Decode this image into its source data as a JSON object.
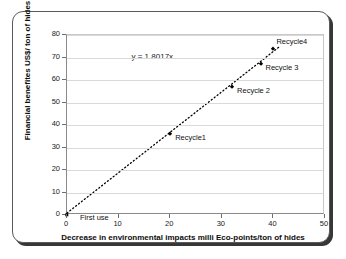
{
  "chart_data": {
    "type": "scatter",
    "title": "",
    "xlabel": "Decrease in environmental impacts milli Eco-points/ton of hides",
    "ylabel": "Financial benefites US$/ ton of hides",
    "xlim": [
      0,
      50
    ],
    "ylim": [
      0,
      80
    ],
    "xticks": [
      0,
      10,
      20,
      30,
      40,
      50
    ],
    "yticks": [
      0,
      10,
      20,
      30,
      40,
      50,
      60,
      70,
      80
    ],
    "grid": "horizontal",
    "legend": "none",
    "annotations": [
      {
        "text": "y = 1.8017x",
        "x": 12.5,
        "y": 70.5
      }
    ],
    "trendline": {
      "equation": "y = 1.8017x",
      "slope": 1.8017,
      "intercept": 0,
      "style": "dotted",
      "color": "#000000",
      "x_from": 0,
      "x_to": 41.5
    },
    "points": [
      {
        "label": "First use",
        "x": 0,
        "y": 0,
        "label_dx": 13,
        "label_dy": 2
      },
      {
        "label": "Recycle1",
        "x": 20,
        "y": 35.8,
        "label_dx": 5,
        "label_dy": 3
      },
      {
        "label": "Recycle 2",
        "x": 32,
        "y": 57.0,
        "label_dx": 5,
        "label_dy": 3
      },
      {
        "label": "Recycle 3",
        "x": 37.5,
        "y": 67.0,
        "label_dx": 5,
        "label_dy": 3
      },
      {
        "label": "Recycle4",
        "x": 40,
        "y": 74.0,
        "label_dx": 3,
        "label_dy": -8
      }
    ],
    "marker_color": "#000000",
    "grid_color": "#d9d9d9",
    "axis_color": "#8a8a8a"
  }
}
